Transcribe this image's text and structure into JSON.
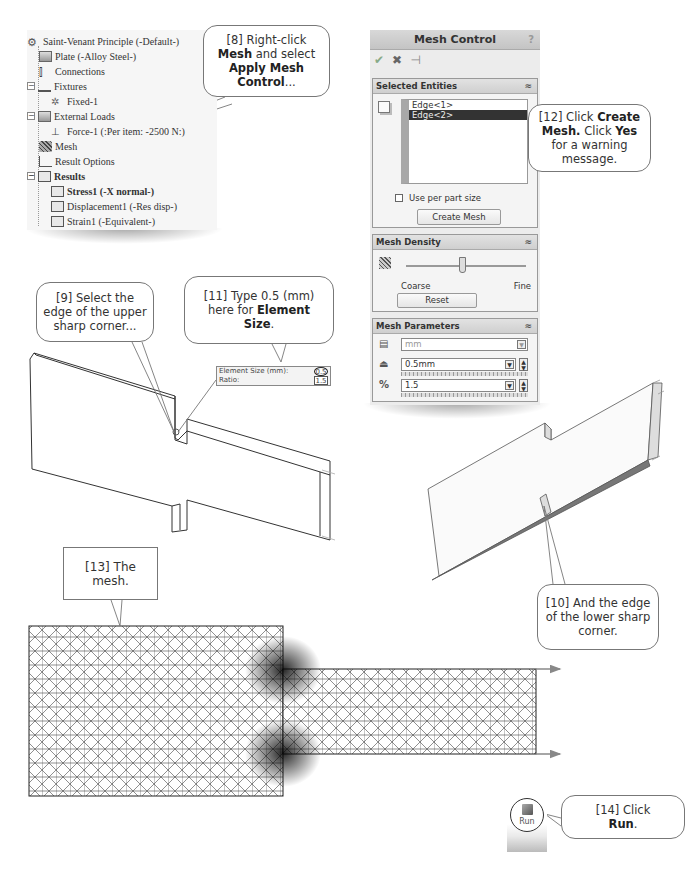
{
  "feature_tree": {
    "items": [
      {
        "label": "Saint-Venant Principle (-Default-)",
        "icon": "study-icon",
        "level": 0
      },
      {
        "label": "Plate (-Alloy Steel-)",
        "icon": "part-icon",
        "level": 1
      },
      {
        "label": "Connections",
        "icon": "connections-icon",
        "level": 1
      },
      {
        "label": "Fixtures",
        "icon": "fixtures-icon",
        "level": 1,
        "expanded": true
      },
      {
        "label": "Fixed-1",
        "icon": "fixed-icon",
        "level": 2
      },
      {
        "label": "External Loads",
        "icon": "external-loads-icon",
        "level": 1,
        "expanded": true
      },
      {
        "label": "Force-1 (:Per item: -2500 N:)",
        "icon": "force-icon",
        "level": 2
      },
      {
        "label": "Mesh",
        "icon": "mesh-icon",
        "level": 1
      },
      {
        "label": "Result Options",
        "icon": "result-options-icon",
        "level": 1
      },
      {
        "label": "Results",
        "icon": "results-folder-icon",
        "level": 1,
        "expanded": true,
        "bold": true
      },
      {
        "label": "Stress1 (-X normal-)",
        "icon": "stress-plot-icon",
        "level": 2,
        "bold": true
      },
      {
        "label": "Displacement1 (-Res disp-)",
        "icon": "displacement-plot-icon",
        "level": 2
      },
      {
        "label": "Strain1 (-Equivalent-)",
        "icon": "strain-plot-icon",
        "level": 2
      }
    ]
  },
  "callouts": {
    "c8": {
      "pre": "[8] Right-click ",
      "b1": "Mesh",
      "mid": " and select ",
      "b2": "Apply Mesh Control",
      "post": "..."
    },
    "c9": {
      "text": "[9] Select the edge of the upper sharp corner..."
    },
    "c10": {
      "text": "[10] And the edge of the lower sharp corner."
    },
    "c11": {
      "pre": "[11] Type 0.5 (mm) here for ",
      "b1": "Element Size",
      "post": "."
    },
    "c12": {
      "pre": "[12] Click ",
      "b1": "Create Mesh.",
      "mid": " Click ",
      "b2": "Yes",
      "post": " for a warning message."
    },
    "c13": {
      "text": "[13] The mesh."
    },
    "c14": {
      "pre": "[14] Click ",
      "b1": "Run",
      "post": "."
    }
  },
  "mesh_control": {
    "title": "Mesh Control",
    "help": "?",
    "actions": {
      "ok": "✔",
      "cancel": "✖",
      "pin": "⊣"
    },
    "selected_entities": {
      "header": "Selected Entities",
      "items": [
        "Edge<1>",
        "Edge<2>"
      ],
      "selected_index": 1,
      "use_per_part_size": "Use per part size",
      "use_per_part_size_checked": false,
      "create_mesh_label": "Create Mesh"
    },
    "mesh_density": {
      "header": "Mesh Density",
      "coarse_label": "Coarse",
      "fine_label": "Fine",
      "reset_label": "Reset"
    },
    "mesh_parameters": {
      "header": "Mesh Parameters",
      "unit": "mm",
      "element_size": "0.5mm",
      "ratio": "1.5"
    }
  },
  "element_size_popup": {
    "size_label": "Element Size (mm):",
    "size_value": "0.5",
    "ratio_label": "Ratio:",
    "ratio_value": "1.5"
  },
  "run_button": {
    "label": "Run"
  }
}
